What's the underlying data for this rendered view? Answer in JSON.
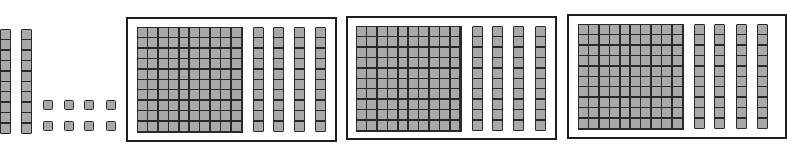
{
  "diagram": {
    "type": "base-ten-blocks",
    "colors": {
      "block_fill": "#a9a9a9",
      "block_border": "#2a2a2a",
      "frame_border": "#1e1e1e",
      "background": "#ffffff"
    },
    "loose": {
      "tens_rods": 2,
      "units": 8,
      "units_layout": {
        "rows": 2,
        "cols": 4
      }
    },
    "groups": [
      {
        "label": "group-1",
        "hundreds": 1,
        "tens": 4
      },
      {
        "label": "group-2",
        "hundreds": 1,
        "tens": 4
      },
      {
        "label": "group-3",
        "hundreds": 1,
        "tens": 4
      }
    ],
    "total_value_shown": 448
  }
}
